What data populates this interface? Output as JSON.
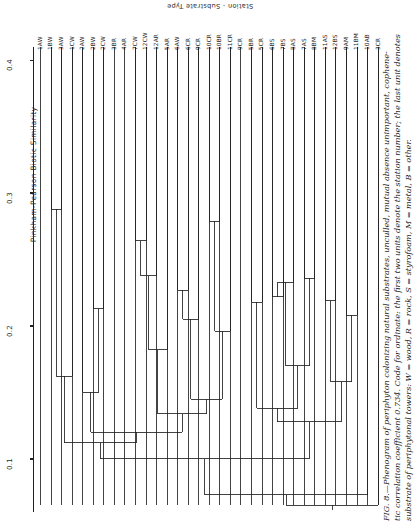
{
  "figure": {
    "axis_y_title": "Pinkham-Pearson Biotic Similarity",
    "axis_top_title": "Station - Substrate Type",
    "caption_line1": "FIG. 8.—Phenogram of periphyton colonizing natural substrates, unculled, mutual absence unimportant, cophene-",
    "caption_line2": "tic correlation coefficient 0.734. Code for ordinate: the first two units denote the station number; the last unit denotes",
    "caption_line3": "substrate of periphytonal towers: W = wood, R = rock, S = styrofoam, M = metal, B = other.",
    "caption_line4": ""
  },
  "chart_data": {
    "type": "dendrogram",
    "title": "Phenogram of periphyton colonizing natural substrates",
    "xlabel": "Station - Substrate Type",
    "ylabel": "Pinkham-Pearson Biotic Similarity",
    "ylim": [
      0.06,
      0.41
    ],
    "yticks": [
      0.4,
      0.3,
      0.2,
      0.1
    ],
    "ytick_labels": [
      "0.4",
      "0.3",
      "0.2",
      "0.1"
    ],
    "cophenetic_correlation": 0.734,
    "grid": false,
    "legend": "none",
    "leaf_labels": [
      "1AW",
      "1BW",
      "3AW",
      "1CW",
      "2AW",
      "2BW",
      "2CW",
      "3BR",
      "4AR",
      "7CW",
      "12CW",
      "12AR",
      "5AR",
      "6AW",
      "6CR",
      "9CR",
      "10CR",
      "10BR",
      "11CR",
      "9CR",
      "5BR",
      "5CR",
      "6BS",
      "7BS",
      "8AS",
      "7AS",
      "8BM",
      "11AS",
      "12BS",
      "9AM",
      "11BM",
      "10AB",
      "3CR"
    ],
    "leaf_count": 33,
    "substrate_legend": [
      {
        "code": "W",
        "meaning": "wood"
      },
      {
        "code": "R",
        "meaning": "rock"
      },
      {
        "code": "S",
        "meaning": "styrofoam"
      },
      {
        "code": "M",
        "meaning": "metal"
      },
      {
        "code": "B",
        "meaning": "other"
      }
    ],
    "merges": [
      {
        "id": "m1",
        "children": [
          "1BW",
          "3AW"
        ],
        "height": 0.288
      },
      {
        "id": "m2",
        "children": [
          "m1",
          "1CW"
        ],
        "height": 0.162
      },
      {
        "id": "m3",
        "children": [
          "2BW",
          "2CW"
        ],
        "height": 0.213
      },
      {
        "id": "m4",
        "children": [
          "m3",
          "2AW"
        ],
        "height": 0.15
      },
      {
        "id": "m5",
        "children": [
          "7CW",
          "12CW"
        ],
        "height": 0.264
      },
      {
        "id": "m6",
        "children": [
          "m5",
          "12AR"
        ],
        "height": 0.238
      },
      {
        "id": "m7",
        "children": [
          "m6",
          "5AR"
        ],
        "height": 0.182
      },
      {
        "id": "m8",
        "children": [
          "6AW",
          "6CR"
        ],
        "height": 0.227
      },
      {
        "id": "m9",
        "children": [
          "m8",
          "9CR"
        ],
        "height": 0.205
      },
      {
        "id": "m10",
        "children": [
          "10CR",
          "10BR"
        ],
        "height": 0.279
      },
      {
        "id": "m11",
        "children": [
          "m10",
          "11CR"
        ],
        "height": 0.196
      },
      {
        "id": "m12",
        "children": [
          "m9",
          "m11"
        ],
        "height": 0.145
      },
      {
        "id": "m13",
        "children": [
          "5BR",
          "5CR"
        ],
        "height": 0.218
      },
      {
        "id": "m14",
        "children": [
          "6BS",
          "7BS"
        ],
        "height": 0.222
      },
      {
        "id": "m15",
        "children": [
          "m14",
          "8AS"
        ],
        "height": 0.233
      },
      {
        "id": "m16",
        "children": [
          "7AS",
          "8BM"
        ],
        "height": 0.236
      },
      {
        "id": "m17",
        "children": [
          "m15",
          "m16"
        ],
        "height": 0.17
      },
      {
        "id": "m18",
        "children": [
          "11AS",
          "12BS"
        ],
        "height": 0.219
      },
      {
        "id": "m19",
        "children": [
          "9AM",
          "11BM"
        ],
        "height": 0.208
      },
      {
        "id": "m20",
        "children": [
          "m18",
          "m19"
        ],
        "height": 0.158
      },
      {
        "id": "m21",
        "children": [
          "m13",
          "m17"
        ],
        "height": 0.138
      },
      {
        "id": "m22",
        "children": [
          "m21",
          "m20"
        ],
        "height": 0.128
      },
      {
        "id": "m23",
        "children": [
          "m7",
          "m12"
        ],
        "height": 0.134
      },
      {
        "id": "m24",
        "children": [
          "m4",
          "m23"
        ],
        "height": 0.12
      },
      {
        "id": "m25",
        "children": [
          "m2",
          "m24"
        ],
        "height": 0.112
      },
      {
        "id": "m26",
        "children": [
          "m25",
          "m22"
        ],
        "height": 0.1
      },
      {
        "id": "m27",
        "children": [
          "m26",
          "10AB"
        ],
        "height": 0.073
      },
      {
        "id": "m28",
        "children": [
          "m27",
          "3CR"
        ],
        "height": 0.065
      }
    ]
  }
}
